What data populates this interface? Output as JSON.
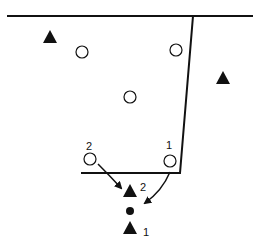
{
  "diagram": {
    "type": "play-diagram",
    "background": "#ffffff",
    "ink": "#111111",
    "baseline": {
      "x1": 7,
      "y1": 16,
      "x2": 253,
      "y2": 16
    },
    "lane": {
      "shape": "trapezoid",
      "points": [
        [
          67,
          16
        ],
        [
          193,
          16
        ],
        [
          180,
          173
        ],
        [
          81,
          173
        ]
      ]
    },
    "offense_circles": [
      {
        "id": "c-top-left",
        "cx": 82,
        "cy": 52,
        "label": ""
      },
      {
        "id": "c-top-right",
        "cx": 176,
        "cy": 50,
        "label": ""
      },
      {
        "id": "c-center",
        "cx": 130,
        "cy": 97,
        "label": ""
      },
      {
        "id": "c-low-left",
        "cx": 90,
        "cy": 159,
        "label": "2"
      },
      {
        "id": "c-low-right",
        "cx": 170,
        "cy": 161,
        "label": "1"
      }
    ],
    "triangles": [
      {
        "id": "t-left",
        "cx": 50,
        "cy": 37,
        "label": ""
      },
      {
        "id": "t-right",
        "cx": 223,
        "cy": 78,
        "label": ""
      },
      {
        "id": "t-2",
        "cx": 130,
        "cy": 191,
        "label": "2"
      },
      {
        "id": "t-1",
        "cx": 130,
        "cy": 228,
        "label": "1"
      }
    ],
    "ball": {
      "cx": 130,
      "cy": 211,
      "r": 4
    },
    "labels": [
      {
        "id": "lbl-circle-2",
        "text": "2",
        "x": 86,
        "y": 150
      },
      {
        "id": "lbl-circle-1",
        "text": "1",
        "x": 166,
        "y": 149
      },
      {
        "id": "lbl-tri-2",
        "text": "2",
        "x": 140,
        "y": 191
      },
      {
        "id": "lbl-tri-1",
        "text": "1",
        "x": 143,
        "y": 236
      }
    ],
    "arrows": [
      {
        "id": "arrow-2",
        "from": [
          98,
          164
        ],
        "to": [
          121,
          188
        ],
        "curve": "M98,164 Q110,176 121,188"
      },
      {
        "id": "arrow-1",
        "from": [
          170,
          172
        ],
        "to": [
          145,
          203
        ],
        "curve": "M170,172 Q162,191 145,203"
      }
    ]
  }
}
